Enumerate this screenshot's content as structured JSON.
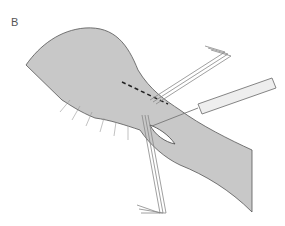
{
  "figure": {
    "panel_label": "B",
    "colors": {
      "tissue_fill": "#c8c8c8",
      "outline": "#555555",
      "instrument": "#888888",
      "background": "#ffffff"
    }
  }
}
